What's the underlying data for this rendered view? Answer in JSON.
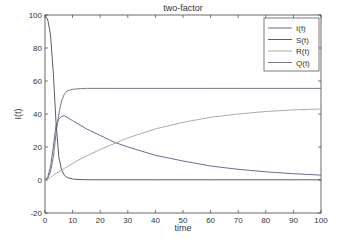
{
  "chart_data": {
    "type": "line",
    "title": "two-factor",
    "xlabel": "time",
    "ylabel": "I(t)",
    "xlim": [
      0,
      100
    ],
    "ylim": [
      -20,
      100
    ],
    "xticks": [
      0,
      10,
      20,
      30,
      40,
      50,
      60,
      70,
      80,
      90,
      100
    ],
    "yticks": [
      -20,
      0,
      20,
      40,
      60,
      80,
      100
    ],
    "grid": false,
    "legend_position": "upper right",
    "x": [
      0,
      1,
      2,
      3,
      4,
      5,
      6,
      7,
      8,
      10,
      12,
      15,
      20,
      25,
      30,
      40,
      50,
      60,
      70,
      80,
      90,
      100
    ],
    "series": [
      {
        "name": "I(t)",
        "color": "#5a5a8a",
        "values": [
          0,
          2,
          8,
          20,
          33,
          37,
          38.5,
          39,
          38,
          36,
          34,
          31,
          27,
          23,
          20,
          15,
          11.5,
          8.5,
          6.5,
          5,
          3.8,
          3
        ]
      },
      {
        "name": "S(t)",
        "color": "#4a4a4a",
        "values": [
          100,
          97,
          88,
          65,
          35,
          14,
          6,
          3,
          1.5,
          0.6,
          0.3,
          0.2,
          0.1,
          0.1,
          0.1,
          0.1,
          0.1,
          0.1,
          0.1,
          0.1,
          0.1,
          0.1
        ]
      },
      {
        "name": "R(t)",
        "color": "#9aa79a",
        "values": [
          0,
          0.5,
          1.5,
          2.8,
          4,
          5,
          6,
          7,
          8,
          10,
          12,
          14.5,
          18.5,
          22,
          25.5,
          31,
          35,
          38,
          40,
          41.5,
          42.5,
          43
        ]
      },
      {
        "name": "Q(t)",
        "color": "#6a6a7a",
        "values": [
          0,
          1,
          5,
          14,
          28,
          40,
          48,
          52,
          54,
          55,
          55.3,
          55.5,
          55.5,
          55.5,
          55.5,
          55.5,
          55.5,
          55.5,
          55.5,
          55.5,
          55.5,
          55.5
        ]
      }
    ]
  }
}
